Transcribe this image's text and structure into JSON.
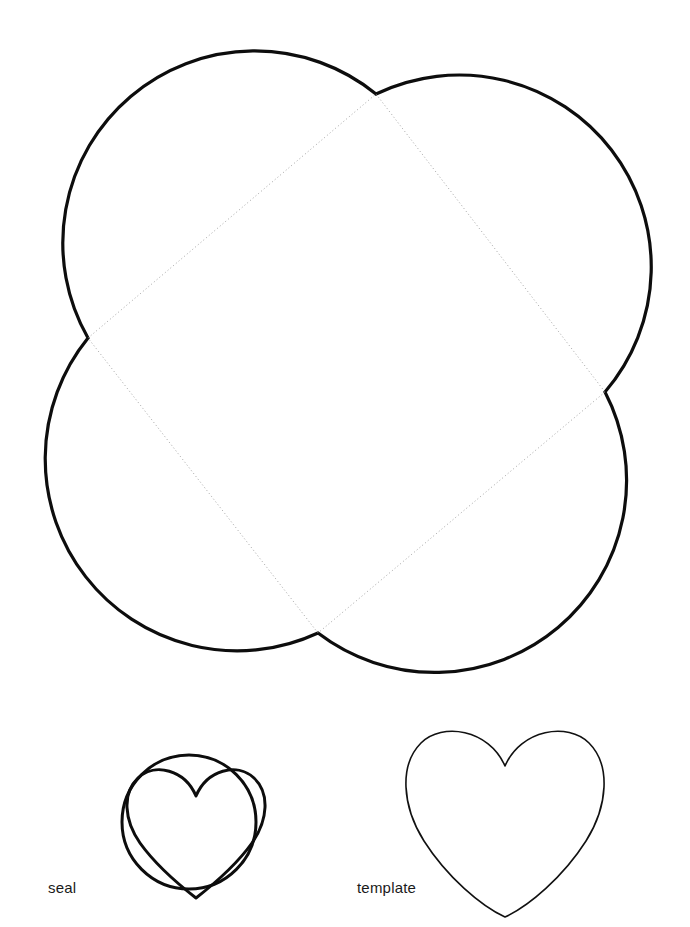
{
  "page": {
    "background_color": "#ffffff",
    "width": 690,
    "height": 927
  },
  "style": {
    "outline_color": "#0d0d0d",
    "outline_width_main": 3.2,
    "outline_width_seal": 3.0,
    "outline_width_template": 1.6,
    "fold_line_color": "#8c8c8c",
    "fold_line_width": 0.8,
    "fold_line_dash": "1,2.6"
  },
  "labels": {
    "seal": "seal",
    "template": "template"
  },
  "label_positions": {
    "seal": {
      "x": 48,
      "y": 893
    },
    "template": {
      "x": 357,
      "y": 893
    }
  },
  "envelope": {
    "name": "four-petal-envelope-body",
    "fold_diamond": {
      "top": {
        "x": 376,
        "y": 94
      },
      "right": {
        "x": 605,
        "y": 392
      },
      "bottom": {
        "x": 318,
        "y": 633
      },
      "left": {
        "x": 88,
        "y": 338
      }
    },
    "petals": [
      {
        "name": "petal-top-left",
        "bulge_apex": {
          "x": 232,
          "y": 18
        }
      },
      {
        "name": "petal-top-right",
        "bulge_apex": {
          "x": 681,
          "y": 255
        }
      },
      {
        "name": "petal-bottom-right",
        "bulge_apex": {
          "x": 460,
          "y": 707
        }
      },
      {
        "name": "petal-bottom-left",
        "bulge_apex": {
          "x": 10,
          "y": 470
        }
      }
    ]
  },
  "seal": {
    "name": "seal-piece",
    "circle": {
      "cx": 189,
      "cy": 822,
      "r": 67
    },
    "heart": {
      "left": 128,
      "right": 252,
      "top": 770,
      "bottom": 897,
      "cleft_x": 196,
      "cleft_y": 796
    }
  },
  "template": {
    "name": "template-heart-piece",
    "heart": {
      "left": 405,
      "right": 607,
      "top": 735,
      "bottom": 917,
      "cleft_x": 505,
      "cleft_y": 766
    }
  }
}
